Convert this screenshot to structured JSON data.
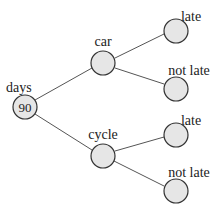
{
  "diagram": {
    "type": "tree",
    "colors": {
      "node_fill": "#e6e6e6",
      "node_stroke": "#333333",
      "edge": "#555555",
      "text": "#222222"
    },
    "root": {
      "label": "days",
      "value": "90"
    },
    "level1": [
      {
        "label": "car",
        "value": ""
      },
      {
        "label": "cycle",
        "value": ""
      }
    ],
    "level2": [
      {
        "parent": "car",
        "label": "late",
        "value": ""
      },
      {
        "parent": "car",
        "label": "not late",
        "value": ""
      },
      {
        "parent": "cycle",
        "label": "late",
        "value": ""
      },
      {
        "parent": "cycle",
        "label": "not late",
        "value": ""
      }
    ]
  }
}
